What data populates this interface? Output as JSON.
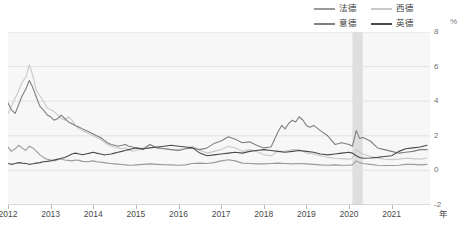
{
  "chart_data": {
    "type": "line",
    "title": "",
    "subtitle": "",
    "xlabel": "年",
    "ylabel": "%",
    "unit": "%",
    "ylim": [
      -2,
      8
    ],
    "yticks": [
      -2,
      0,
      2,
      4,
      6,
      8
    ],
    "xlim": [
      2012.0,
      2021.9
    ],
    "xticks": [
      2012,
      2013,
      2014,
      2015,
      2016,
      2017,
      2018,
      2019,
      2020,
      2021
    ],
    "xticklabels": [
      "2012",
      "2013",
      "2014",
      "2015",
      "2016",
      "2017",
      "2018",
      "2019",
      "2020",
      "2021"
    ],
    "grid": true,
    "legend_position": "top-right",
    "colors": {
      "fade": "#9a9a9a",
      "xide": "#c9c9c9",
      "yide": "#7f7f7f",
      "yingde": "#4a4a4a",
      "plot_background": "#f7f7f7",
      "gridline": "#e2e2e2",
      "shaded_band": "#d9d9d9"
    },
    "annotations": [
      {
        "type": "vspan",
        "label": "",
        "x0": 2020.08,
        "x1": 2020.32,
        "color": "#d9d9d9"
      }
    ],
    "series": [
      {
        "name": "法德",
        "color": "#9a9a9a",
        "x": [
          2012.0,
          2012.08,
          2012.17,
          2012.25,
          2012.33,
          2012.42,
          2012.5,
          2012.58,
          2012.67,
          2012.75,
          2012.83,
          2012.92,
          2013.0,
          2013.08,
          2013.17,
          2013.25,
          2013.33,
          2013.42,
          2013.5,
          2013.58,
          2013.67,
          2013.75,
          2013.83,
          2013.92,
          2014.0,
          2014.08,
          2014.17,
          2014.25,
          2014.33,
          2014.42,
          2014.5,
          2014.58,
          2014.67,
          2014.75,
          2014.83,
          2014.92,
          2015.0,
          2015.17,
          2015.33,
          2015.5,
          2015.67,
          2015.83,
          2016.0,
          2016.17,
          2016.33,
          2016.5,
          2016.67,
          2016.83,
          2017.0,
          2017.17,
          2017.33,
          2017.5,
          2017.67,
          2017.83,
          2018.0,
          2018.17,
          2018.33,
          2018.5,
          2018.67,
          2018.83,
          2019.0,
          2019.17,
          2019.33,
          2019.5,
          2019.67,
          2019.83,
          2020.0,
          2020.08,
          2020.17,
          2020.25,
          2020.33,
          2020.5,
          2020.67,
          2020.83,
          2021.0,
          2021.17,
          2021.33,
          2021.5,
          2021.67,
          2021.83
        ],
        "y": [
          1.35,
          1.1,
          1.25,
          1.45,
          1.3,
          1.15,
          1.4,
          1.3,
          1.1,
          0.9,
          0.75,
          0.65,
          0.6,
          0.55,
          0.62,
          0.68,
          0.6,
          0.58,
          0.55,
          0.6,
          0.58,
          0.52,
          0.5,
          0.52,
          0.55,
          0.5,
          0.48,
          0.45,
          0.42,
          0.4,
          0.38,
          0.36,
          0.34,
          0.32,
          0.3,
          0.3,
          0.32,
          0.35,
          0.38,
          0.35,
          0.33,
          0.32,
          0.3,
          0.32,
          0.4,
          0.42,
          0.4,
          0.45,
          0.55,
          0.62,
          0.55,
          0.42,
          0.4,
          0.38,
          0.38,
          0.4,
          0.42,
          0.4,
          0.38,
          0.4,
          0.38,
          0.35,
          0.32,
          0.3,
          0.32,
          0.3,
          0.3,
          0.32,
          0.55,
          0.45,
          0.4,
          0.35,
          0.3,
          0.28,
          0.28,
          0.3,
          0.35,
          0.35,
          0.32,
          0.35
        ]
      },
      {
        "name": "西德",
        "color": "#c9c9c9",
        "x": [
          2012.0,
          2012.08,
          2012.17,
          2012.25,
          2012.33,
          2012.42,
          2012.5,
          2012.58,
          2012.67,
          2012.75,
          2012.83,
          2012.92,
          2013.0,
          2013.08,
          2013.17,
          2013.25,
          2013.33,
          2013.42,
          2013.5,
          2013.58,
          2013.67,
          2013.75,
          2013.83,
          2013.92,
          2014.0,
          2014.08,
          2014.17,
          2014.25,
          2014.33,
          2014.42,
          2014.5,
          2014.58,
          2014.67,
          2014.75,
          2014.83,
          2014.92,
          2015.0,
          2015.17,
          2015.33,
          2015.5,
          2015.67,
          2015.83,
          2016.0,
          2016.17,
          2016.33,
          2016.5,
          2016.67,
          2016.83,
          2017.0,
          2017.17,
          2017.33,
          2017.5,
          2017.67,
          2017.83,
          2018.0,
          2018.17,
          2018.33,
          2018.5,
          2018.67,
          2018.83,
          2019.0,
          2019.17,
          2019.33,
          2019.5,
          2019.67,
          2019.83,
          2020.0,
          2020.08,
          2020.17,
          2020.25,
          2020.33,
          2020.5,
          2020.67,
          2020.83,
          2021.0,
          2021.17,
          2021.33,
          2021.5,
          2021.67,
          2021.83
        ],
        "y": [
          3.3,
          3.7,
          4.2,
          4.6,
          5.1,
          5.4,
          6.1,
          5.5,
          4.6,
          4.3,
          4.0,
          3.6,
          3.5,
          3.4,
          3.2,
          3.0,
          2.9,
          3.1,
          2.9,
          2.6,
          2.4,
          2.3,
          2.2,
          2.1,
          2.0,
          1.9,
          1.8,
          1.65,
          1.5,
          1.4,
          1.35,
          1.3,
          1.25,
          1.3,
          1.2,
          1.1,
          1.15,
          1.3,
          1.5,
          1.3,
          1.25,
          1.2,
          1.2,
          1.25,
          1.4,
          1.15,
          1.0,
          1.1,
          1.2,
          1.4,
          1.3,
          1.1,
          1.2,
          1.1,
          0.9,
          0.85,
          1.1,
          1.1,
          1.2,
          1.2,
          1.0,
          0.95,
          0.85,
          0.75,
          0.7,
          0.68,
          0.65,
          0.7,
          1.2,
          1.05,
          0.95,
          0.8,
          0.72,
          0.65,
          0.62,
          0.65,
          0.7,
          0.68,
          0.65,
          0.72
        ]
      },
      {
        "name": "意德",
        "color": "#7f7f7f",
        "x": [
          2012.0,
          2012.08,
          2012.17,
          2012.25,
          2012.33,
          2012.42,
          2012.5,
          2012.58,
          2012.67,
          2012.75,
          2012.83,
          2012.92,
          2013.0,
          2013.08,
          2013.17,
          2013.25,
          2013.33,
          2013.42,
          2013.5,
          2013.58,
          2013.67,
          2013.75,
          2013.83,
          2013.92,
          2014.0,
          2014.08,
          2014.17,
          2014.25,
          2014.33,
          2014.42,
          2014.5,
          2014.58,
          2014.67,
          2014.75,
          2014.83,
          2014.92,
          2015.0,
          2015.17,
          2015.33,
          2015.5,
          2015.67,
          2015.83,
          2016.0,
          2016.17,
          2016.33,
          2016.5,
          2016.67,
          2016.83,
          2017.0,
          2017.17,
          2017.33,
          2017.5,
          2017.67,
          2017.83,
          2018.0,
          2018.17,
          2018.33,
          2018.42,
          2018.5,
          2018.58,
          2018.67,
          2018.75,
          2018.83,
          2018.92,
          2019.0,
          2019.08,
          2019.17,
          2019.33,
          2019.5,
          2019.67,
          2019.83,
          2020.0,
          2020.08,
          2020.17,
          2020.25,
          2020.33,
          2020.5,
          2020.67,
          2020.83,
          2021.0,
          2021.17,
          2021.33,
          2021.5,
          2021.67,
          2021.83
        ],
        "y": [
          3.9,
          3.5,
          3.3,
          3.8,
          4.3,
          4.7,
          5.2,
          4.8,
          4.2,
          3.7,
          3.5,
          3.2,
          3.1,
          2.9,
          3.0,
          3.2,
          3.0,
          2.8,
          2.7,
          2.6,
          2.5,
          2.4,
          2.3,
          2.2,
          2.1,
          2.0,
          1.9,
          1.75,
          1.6,
          1.5,
          1.45,
          1.4,
          1.45,
          1.5,
          1.4,
          1.35,
          1.3,
          1.2,
          1.5,
          1.3,
          1.25,
          1.2,
          1.15,
          1.25,
          1.3,
          1.2,
          1.3,
          1.55,
          1.7,
          1.95,
          1.8,
          1.6,
          1.65,
          1.45,
          1.3,
          1.35,
          2.2,
          2.6,
          2.4,
          2.7,
          2.9,
          2.8,
          3.1,
          2.9,
          2.6,
          2.5,
          2.6,
          2.3,
          2.0,
          1.5,
          1.6,
          1.5,
          1.4,
          2.3,
          1.85,
          1.9,
          1.7,
          1.3,
          1.2,
          1.1,
          1.0,
          1.05,
          1.1,
          1.2,
          1.2
        ]
      },
      {
        "name": "英德",
        "color": "#4a4a4a",
        "x": [
          2012.0,
          2012.08,
          2012.17,
          2012.25,
          2012.33,
          2012.42,
          2012.5,
          2012.58,
          2012.67,
          2012.75,
          2012.83,
          2012.92,
          2013.0,
          2013.08,
          2013.17,
          2013.25,
          2013.33,
          2013.42,
          2013.5,
          2013.58,
          2013.67,
          2013.75,
          2013.83,
          2013.92,
          2014.0,
          2014.08,
          2014.17,
          2014.25,
          2014.33,
          2014.42,
          2014.5,
          2014.58,
          2014.67,
          2014.75,
          2014.83,
          2014.92,
          2015.0,
          2015.17,
          2015.33,
          2015.5,
          2015.67,
          2015.83,
          2016.0,
          2016.17,
          2016.33,
          2016.5,
          2016.67,
          2016.83,
          2017.0,
          2017.17,
          2017.33,
          2017.5,
          2017.67,
          2017.83,
          2018.0,
          2018.17,
          2018.33,
          2018.5,
          2018.67,
          2018.83,
          2019.0,
          2019.17,
          2019.33,
          2019.5,
          2019.67,
          2019.83,
          2020.0,
          2020.08,
          2020.17,
          2020.25,
          2020.33,
          2020.5,
          2020.67,
          2020.83,
          2021.0,
          2021.17,
          2021.33,
          2021.5,
          2021.67,
          2021.83
        ],
        "y": [
          0.4,
          0.35,
          0.4,
          0.45,
          0.42,
          0.4,
          0.35,
          0.38,
          0.42,
          0.45,
          0.5,
          0.52,
          0.55,
          0.6,
          0.65,
          0.7,
          0.75,
          0.85,
          0.95,
          1.0,
          0.95,
          0.9,
          0.95,
          1.0,
          1.05,
          1.0,
          0.95,
          0.9,
          0.92,
          0.95,
          1.0,
          1.05,
          1.1,
          1.15,
          1.2,
          1.25,
          1.3,
          1.25,
          1.3,
          1.35,
          1.4,
          1.45,
          1.4,
          1.35,
          1.3,
          1.0,
          0.85,
          0.9,
          0.95,
          1.0,
          1.05,
          1.0,
          1.1,
          1.15,
          1.2,
          1.15,
          1.1,
          1.05,
          1.1,
          1.15,
          1.1,
          1.05,
          0.95,
          0.9,
          0.95,
          1.0,
          1.05,
          1.0,
          0.85,
          0.75,
          0.7,
          0.72,
          0.75,
          0.8,
          0.85,
          1.1,
          1.25,
          1.3,
          1.35,
          1.45
        ]
      }
    ]
  },
  "legend": {
    "rows": [
      [
        {
          "label": "法德",
          "series": "法德"
        },
        {
          "label": "西德",
          "series": "西德"
        }
      ],
      [
        {
          "label": "意德",
          "series": "意德"
        },
        {
          "label": "英德",
          "series": "英德"
        }
      ]
    ],
    "unit": "%"
  },
  "axes": {
    "y_unit": "%",
    "y_ticklabels": [
      "8",
      "6",
      "4",
      "2",
      "0",
      "-2"
    ],
    "x_ticklabels": [
      "2012",
      "2013",
      "2014",
      "2015",
      "2016",
      "2017",
      "2018",
      "2019",
      "2020",
      "2021"
    ],
    "x_unit": "年"
  }
}
